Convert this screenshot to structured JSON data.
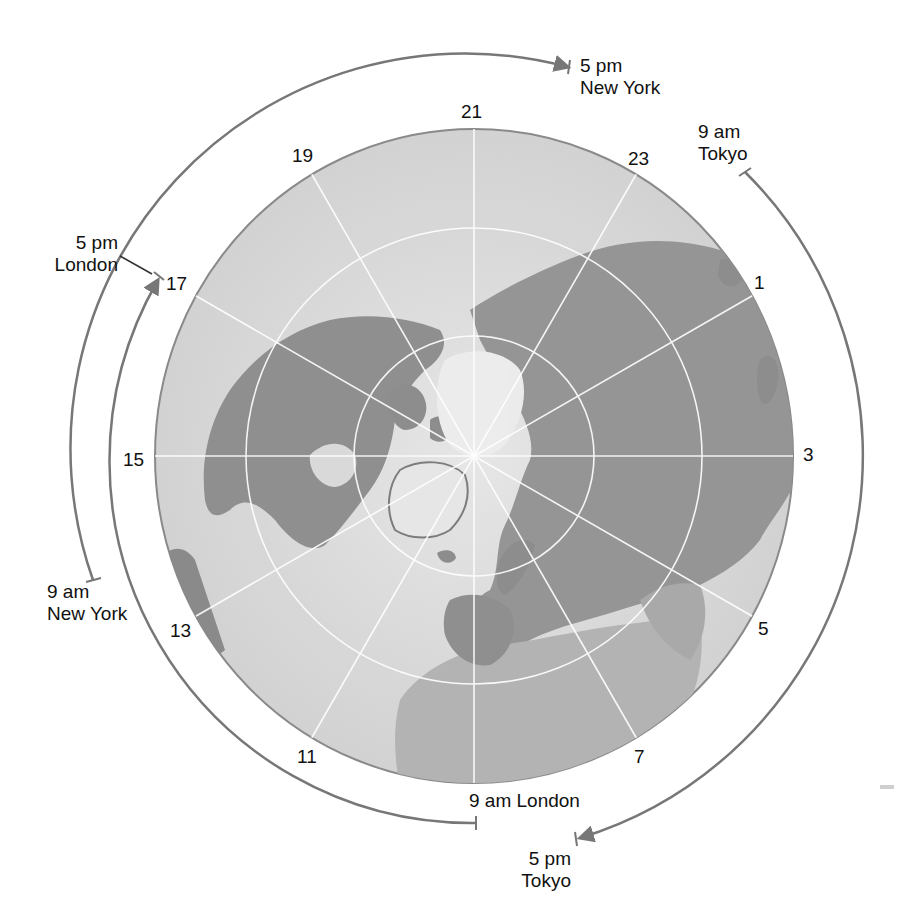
{
  "figure": {
    "title": "",
    "colors": {
      "ocean": "#d9d9d9",
      "land": "#959595",
      "land_dark": "#7d7d7d",
      "ice": "#eeeeee",
      "greenland": "#e4e4e4",
      "graticule": "#ffffff",
      "arc": "#777777",
      "text": "#111111",
      "globe_edge": "#8a8a8a"
    }
  },
  "hour_labels": [
    {
      "id": "h21",
      "text": "21"
    },
    {
      "id": "h23",
      "text": "23"
    },
    {
      "id": "h1",
      "text": "1"
    },
    {
      "id": "h3",
      "text": "3"
    },
    {
      "id": "h5",
      "text": "5"
    },
    {
      "id": "h7",
      "text": "7"
    },
    {
      "id": "h11",
      "text": "11"
    },
    {
      "id": "h13",
      "text": "13"
    },
    {
      "id": "h15",
      "text": "15"
    },
    {
      "id": "h17",
      "text": "17"
    },
    {
      "id": "h19",
      "text": "19"
    }
  ],
  "arcs": {
    "new_york": {
      "start_label": "9 am",
      "start_city": "New York",
      "end_label": "5 pm",
      "end_city": "New York"
    },
    "london": {
      "start_label": "9 am London",
      "end_label": "5 pm",
      "end_city": "London"
    },
    "tokyo": {
      "start_label": "9 am",
      "start_city": "Tokyo",
      "end_label": "5 pm",
      "end_city": "Tokyo"
    }
  }
}
